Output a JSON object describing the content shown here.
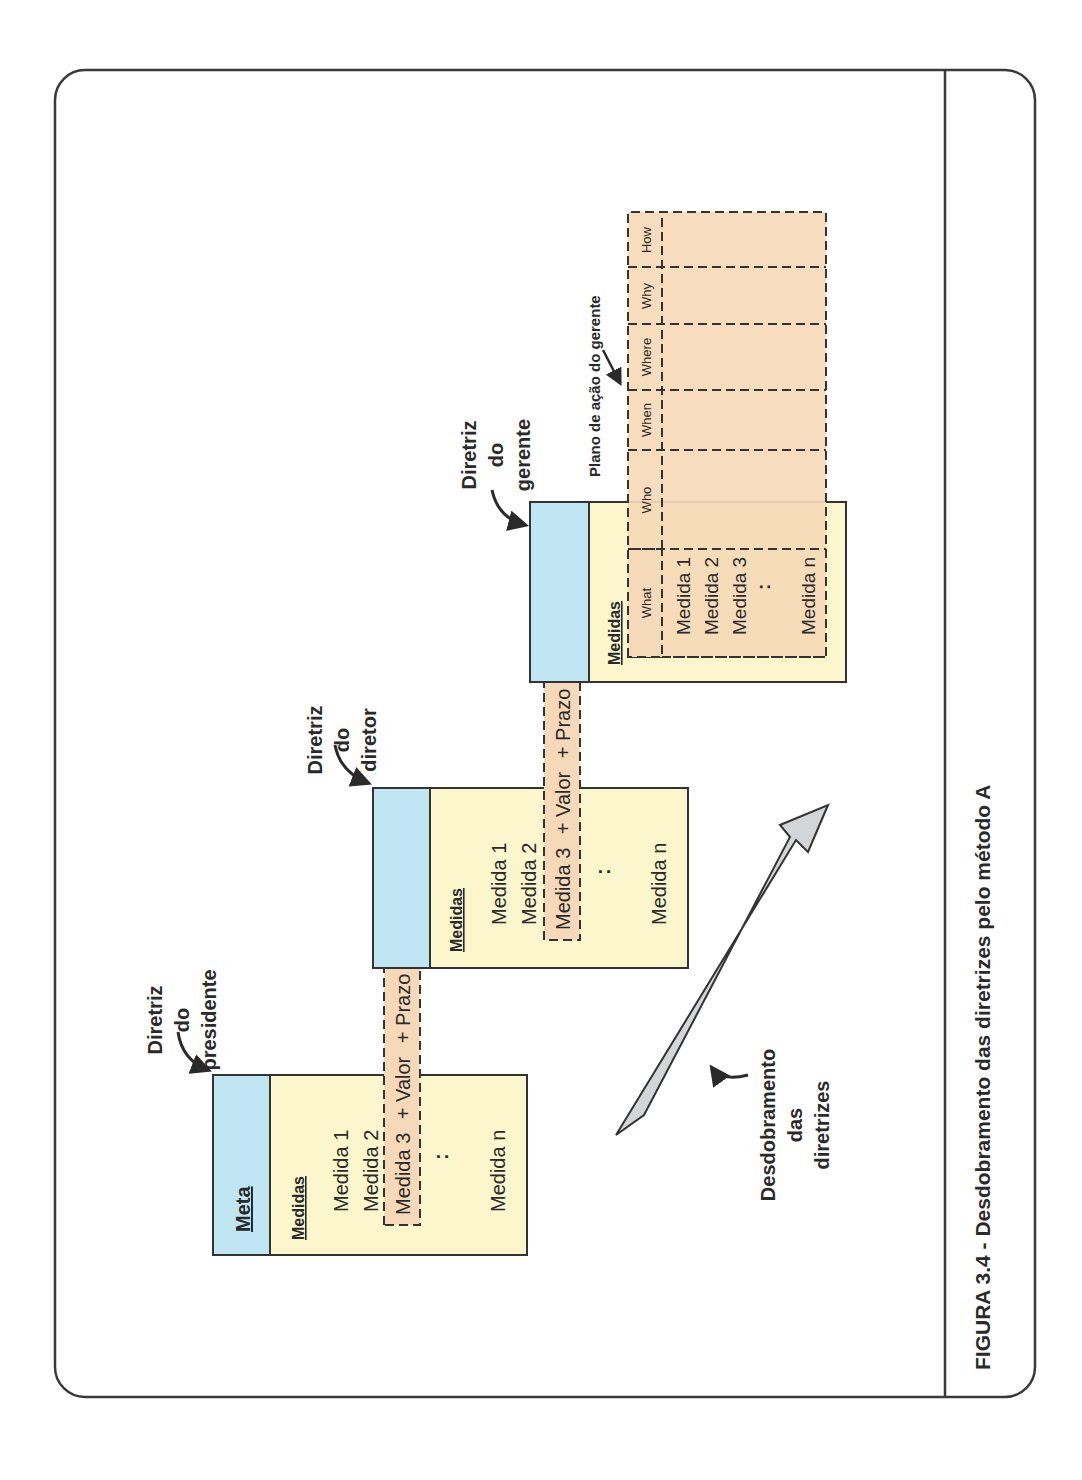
{
  "figure": {
    "caption": "FIGURA 3.4 - Desdobramento das diretrizes pelo método A",
    "orientation": "rotated 90° counter-clockwise"
  },
  "colors": {
    "meta_header": "#bfe6f2",
    "body": "#fbf6cc",
    "highlight": "#f6d9b8",
    "arrow_fill": "#d3d6d9",
    "stroke": "#333333"
  },
  "president": {
    "label_line1": "Diretriz",
    "label_line2": "do",
    "label_line3": "presidente",
    "header": "Meta",
    "section": "Medidas",
    "items": [
      "Medida 1",
      "Medida 2",
      "Medida 3",
      ":",
      "Medida n"
    ]
  },
  "director": {
    "label_line1": "Diretriz",
    "label_line2": "do",
    "label_line3": "diretor",
    "section": "Medidas",
    "items": [
      "Medida 1",
      "Medida 2",
      "Medida 3",
      ":",
      "Medida n"
    ]
  },
  "manager": {
    "label_line1": "Diretriz",
    "label_line2": "do",
    "label_line3": "gerente",
    "section": "Medidas",
    "items": [
      "Medida 1",
      "Medida 2",
      "Medida 3",
      ":",
      "Medida n"
    ]
  },
  "deployment_strip": {
    "part1": "Medida 3",
    "part2": "+ Valor",
    "part3": "+ Prazo",
    "part4": "=",
    "part5": "Meta"
  },
  "action_plan": {
    "label": "Plano de ação do gerente",
    "columns": [
      "What",
      "Who",
      "When",
      "Where",
      "Why",
      "How"
    ]
  },
  "flow_arrow": {
    "label_line1": "Desdobramento",
    "label_line2": "das",
    "label_line3": "diretrizes"
  }
}
